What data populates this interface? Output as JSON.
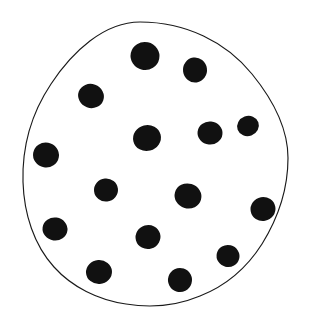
{
  "figure": {
    "kind": "dot-count-blob",
    "background_color": "#ffffff",
    "canvas": {
      "width": 311,
      "height": 332
    },
    "outline": {
      "name": "hand-drawn-closed-blob",
      "stroke_color": "#1a1a1a",
      "fill_color": "#ffffff",
      "stroke_width": 1.15,
      "extents": {
        "left": 23,
        "right": 288,
        "top": 22,
        "bottom": 307
      },
      "path": "M 140 22 C 186 22 226 42 252 74 C 274 101 288 130 288 158 C 288 186 280 215 262 244 C 248 266 228 285 200 296 C 176 306 150 308 126 304 C 98 300 72 287 54 267 C 34 245 24 214 23 182 C 22 148 31 114 51 84 C 72 52 104 22 140 22 Z"
    },
    "dot_style": {
      "fill_color": "#111111",
      "shape": "irregular-filled-circle"
    },
    "dot_count": 16,
    "dots": [
      {
        "id": 1,
        "name": "dot-top-center",
        "cx": 145,
        "cy": 56,
        "rx": 14.5,
        "ry": 14.0,
        "rotate": 12
      },
      {
        "id": 2,
        "name": "dot-top-right",
        "cx": 195,
        "cy": 70,
        "rx": 12.0,
        "ry": 12.5,
        "rotate": -8
      },
      {
        "id": 3,
        "name": "dot-upper-left",
        "cx": 91,
        "cy": 96,
        "rx": 13.0,
        "ry": 12.0,
        "rotate": 20
      },
      {
        "id": 4,
        "name": "dot-middle-center",
        "cx": 147,
        "cy": 138,
        "rx": 14.0,
        "ry": 13.0,
        "rotate": -14
      },
      {
        "id": 5,
        "name": "dot-middle-right",
        "cx": 210,
        "cy": 133,
        "rx": 12.5,
        "ry": 11.5,
        "rotate": 6
      },
      {
        "id": 6,
        "name": "dot-right-edge-upper",
        "cx": 248,
        "cy": 126,
        "rx": 11.0,
        "ry": 10.0,
        "rotate": -20
      },
      {
        "id": 7,
        "name": "dot-left-edge-upper",
        "cx": 46,
        "cy": 155,
        "rx": 13.0,
        "ry": 12.5,
        "rotate": 10
      },
      {
        "id": 8,
        "name": "dot-center-left",
        "cx": 106,
        "cy": 190,
        "rx": 12.0,
        "ry": 11.5,
        "rotate": -6
      },
      {
        "id": 9,
        "name": "dot-center-right",
        "cx": 188,
        "cy": 196,
        "rx": 13.5,
        "ry": 12.5,
        "rotate": 16
      },
      {
        "id": 10,
        "name": "dot-right-edge-lower",
        "cx": 263,
        "cy": 209,
        "rx": 12.5,
        "ry": 12.0,
        "rotate": -10
      },
      {
        "id": 11,
        "name": "dot-left-edge-lower",
        "cx": 55,
        "cy": 229,
        "rx": 12.5,
        "ry": 11.5,
        "rotate": 8
      },
      {
        "id": 12,
        "name": "dot-lower-center",
        "cx": 148,
        "cy": 237,
        "rx": 12.5,
        "ry": 12.0,
        "rotate": -16
      },
      {
        "id": 13,
        "name": "dot-lower-right",
        "cx": 228,
        "cy": 256,
        "rx": 11.5,
        "ry": 11.0,
        "rotate": 14
      },
      {
        "id": 14,
        "name": "dot-bottom-left",
        "cx": 99,
        "cy": 272,
        "rx": 13.0,
        "ry": 12.0,
        "rotate": -4
      },
      {
        "id": 15,
        "name": "dot-bottom-center",
        "cx": 180,
        "cy": 280,
        "rx": 12.0,
        "ry": 12.0,
        "rotate": 18
      },
      {
        "id": 16,
        "name": "dot-upper-mid-left",
        "cx": 112,
        "cy": 160,
        "rx": 0.0,
        "ry": 0.0,
        "rotate": 0
      }
    ]
  }
}
